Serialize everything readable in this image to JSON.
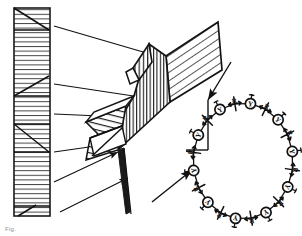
{
  "figure": {
    "background_color": "#ffffff",
    "ink_color": "#1a1a1a",
    "hatch_color": "#3a3a3a"
  },
  "panels": {
    "left": {
      "name": "stacked-lamellae-column",
      "description": "Tall vertical rectangle filled with horizontal hatch lines and diagonal grain boundaries",
      "x": 14,
      "y": 8,
      "width": 36,
      "height": 208,
      "hatch_line_count": 38,
      "diagonal_boundaries": [
        {
          "x1": 14,
          "y1": 8,
          "x2": 50,
          "y2": 30
        },
        {
          "x1": 14,
          "y1": 30,
          "x2": 50,
          "y2": 30
        },
        {
          "x1": 14,
          "y1": 96,
          "x2": 50,
          "y2": 76
        },
        {
          "x1": 14,
          "y1": 96,
          "x2": 50,
          "y2": 96
        },
        {
          "x1": 14,
          "y1": 124,
          "x2": 50,
          "y2": 152
        },
        {
          "x1": 14,
          "y1": 124,
          "x2": 50,
          "y2": 124
        },
        {
          "x1": 14,
          "y1": 152,
          "x2": 50,
          "y2": 152
        },
        {
          "x1": 14,
          "y1": 206,
          "x2": 34,
          "y2": 216
        },
        {
          "x1": 14,
          "y1": 206,
          "x2": 50,
          "y2": 206
        }
      ]
    },
    "middle": {
      "name": "twisted-ribbon-surface",
      "description": "Helically twisted lamellar ribbon drawn in perspective with diagonal and vertical hatching",
      "facets": [
        {
          "name": "top-right-hatched-face",
          "hatch": "diagonal"
        },
        {
          "name": "central-vertical-face",
          "hatch": "vertical"
        },
        {
          "name": "lower-left-hatched-face",
          "hatch": "horizontal"
        },
        {
          "name": "small-triangular-notch",
          "hatch": "vertical"
        }
      ]
    },
    "right": {
      "name": "molecular-ring",
      "description": "Circular arrangement of mesogen units alternating between Y-in-circle glyphs and R-labelled cross glyphs",
      "center_x": 243,
      "center_y": 161,
      "radius_x": 50,
      "radius_y": 58,
      "unit_count": 20,
      "unit_labels": [
        "Y",
        "R"
      ],
      "circle_glyph": "Y",
      "label_glyph": "R"
    }
  },
  "arrows": [
    {
      "name": "arrow-lamella-1",
      "x1": 54,
      "y1": 26,
      "x2": 176,
      "y2": 62,
      "head": true
    },
    {
      "name": "arrow-lamella-2",
      "x1": 54,
      "y1": 72,
      "x2": 162,
      "y2": 84,
      "head": true
    },
    {
      "name": "arrow-lamella-3",
      "x1": 54,
      "y1": 100,
      "x2": 150,
      "y2": 100,
      "head": true
    },
    {
      "name": "arrow-lamella-4",
      "x1": 54,
      "y1": 148,
      "x2": 128,
      "y2": 140,
      "head": true
    },
    {
      "name": "arrow-lamella-5",
      "x1": 54,
      "y1": 176,
      "x2": 118,
      "y2": 150,
      "head": true
    },
    {
      "name": "arrow-lamella-6",
      "x1": 54,
      "y1": 208,
      "x2": 130,
      "y2": 182,
      "head": true
    },
    {
      "name": "arrow-ribbon-to-ring-top",
      "x1": 226,
      "y1": 70,
      "x2": 205,
      "y2": 104,
      "head": true
    },
    {
      "name": "arrow-ribbon-to-ring-left",
      "x1": 152,
      "y1": 200,
      "x2": 196,
      "y2": 166,
      "head": true
    }
  ],
  "leader_lines": [
    {
      "name": "leader-ring-vertical",
      "x1": 207,
      "y1": 104,
      "x2": 207,
      "y2": 148
    },
    {
      "name": "leader-ring-horizontal",
      "x1": 185,
      "y1": 148,
      "x2": 207,
      "y2": 148
    }
  ],
  "caption": {
    "text": "Fig. 1. …",
    "visible_fragment": "Fig.",
    "color": "#8c8c8c"
  }
}
